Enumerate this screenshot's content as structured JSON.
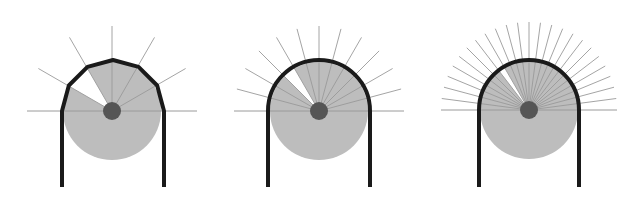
{
  "figure": {
    "colors": {
      "background": "#ffffff",
      "disk_fill": "#bdbdbd",
      "hub_fill": "#555555",
      "outline": "#1a1a1a",
      "ray": "#9a9a9a",
      "wedge": "#ffffff"
    },
    "panels": [
      {
        "name": "panel-coarse",
        "cx": 112,
        "cy": 111,
        "r": 49,
        "wall_left": 62,
        "wall_right": 164,
        "wall_bottom": 187,
        "sectors": 6,
        "ray_length": 85,
        "wedge_sector": 4,
        "hub_r": 9,
        "polygonal": true
      },
      {
        "name": "panel-medium",
        "cx": 319,
        "cy": 111,
        "r": 49,
        "wall_left": 268,
        "wall_right": 370,
        "wall_bottom": 187,
        "sectors": 12,
        "ray_length": 85,
        "wedge_sector": 8,
        "hub_r": 9,
        "polygonal": false
      },
      {
        "name": "panel-fine",
        "cx": 529,
        "cy": 110,
        "r": 49,
        "wall_left": 479,
        "wall_right": 579,
        "wall_bottom": 187,
        "sectors": 24,
        "ray_length": 88,
        "wedge_sector": 16,
        "hub_r": 9,
        "polygonal": false
      }
    ]
  }
}
